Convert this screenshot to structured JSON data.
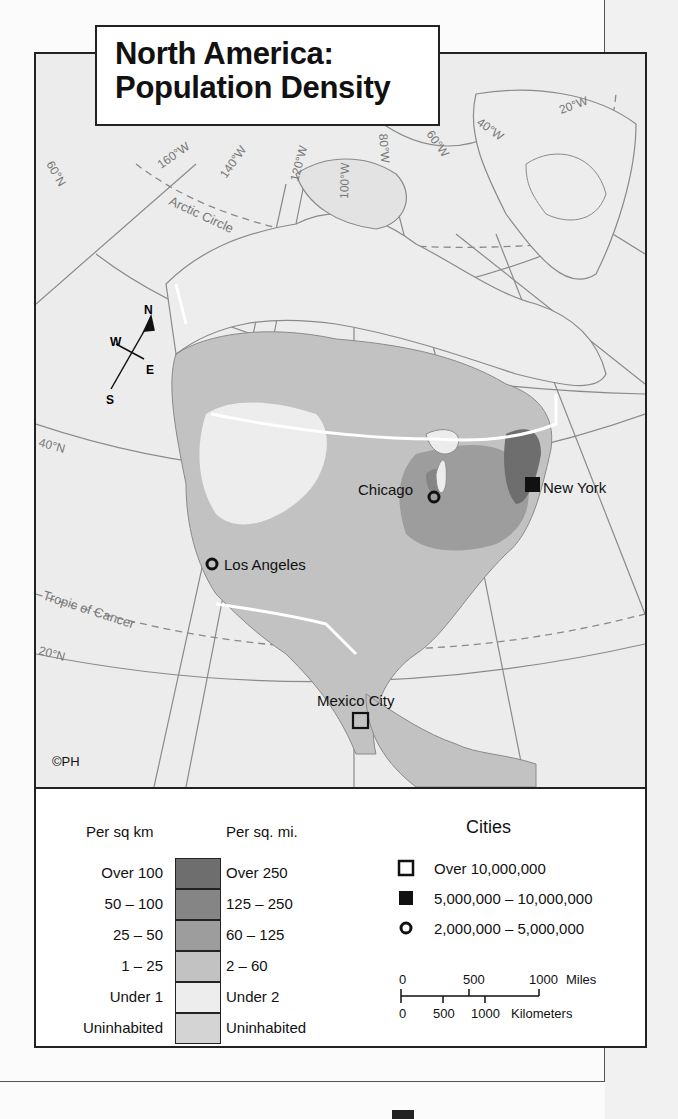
{
  "title": {
    "line1": "North America:",
    "line2": "Population Density"
  },
  "map": {
    "copyright": "©PH",
    "background_color": "#ececec",
    "graticule_labels": [
      "160°W",
      "140°W",
      "120°W",
      "100°W",
      "80°W",
      "60°W",
      "40°W",
      "20°W",
      "60°N",
      "40°N",
      "20°N"
    ],
    "special_lines": [
      "Arctic Circle",
      "Tropic of Cancer"
    ],
    "compass": {
      "n": "N",
      "s": "S",
      "e": "E",
      "w": "W"
    },
    "cities": [
      {
        "name": "Chicago",
        "symbol": "circle",
        "category": "2,000,000-5,000,000"
      },
      {
        "name": "New York",
        "symbol": "filled-square",
        "category": "5,000,000-10,000,000"
      },
      {
        "name": "Los Angeles",
        "symbol": "circle",
        "category": "2,000,000-5,000,000"
      },
      {
        "name": "Mexico City",
        "symbol": "open-square",
        "category": "Over 10,000,000"
      }
    ]
  },
  "legend": {
    "density": {
      "header_km": "Per sq km",
      "header_mi": "Per sq. mi.",
      "rows": [
        {
          "km": "Over 100",
          "mi": "Over 250",
          "color": "#6e6e6e"
        },
        {
          "km": "50 – 100",
          "mi": "125 – 250",
          "color": "#858585"
        },
        {
          "km": "25 – 50",
          "mi": "60 – 125",
          "color": "#9d9d9d"
        },
        {
          "km": "1 – 25",
          "mi": "2 – 60",
          "color": "#c2c2c2"
        },
        {
          "km": "Under 1",
          "mi": "Under 2",
          "color": "#ededed"
        },
        {
          "km": "Uninhabited",
          "mi": "Uninhabited",
          "color": "#d4d4d4"
        }
      ]
    },
    "cities": {
      "title": "Cities",
      "rows": [
        {
          "symbol": "open-square",
          "label": "Over 10,000,000"
        },
        {
          "symbol": "filled-square",
          "label": "5,000,000 – 10,000,000"
        },
        {
          "symbol": "circle",
          "label": "2,000,000 – 5,000,000"
        }
      ]
    },
    "scale": {
      "miles": {
        "ticks": [
          "0",
          "500",
          "1000"
        ],
        "unit": "Miles"
      },
      "km": {
        "ticks": [
          "0",
          "500",
          "1000"
        ],
        "unit": "Kilometers"
      }
    }
  }
}
